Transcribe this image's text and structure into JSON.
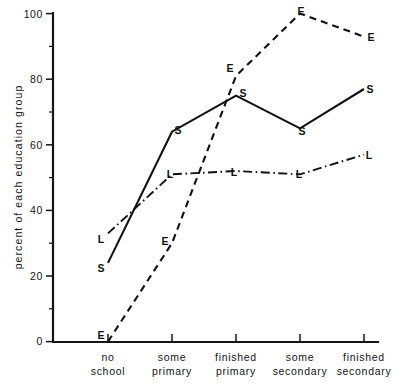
{
  "chart_data": {
    "type": "line",
    "title": "",
    "xlabel": "",
    "ylabel": "percent of each education group",
    "ylim": [
      0,
      100
    ],
    "grid": false,
    "legend_position": "inline-point-labels",
    "categories": [
      "no school",
      "some primary",
      "finished primary",
      "some secondary",
      "finished secondary"
    ],
    "category_lines": [
      [
        "no",
        "school"
      ],
      [
        "some",
        "primary"
      ],
      [
        "finished",
        "primary"
      ],
      [
        "some",
        "secondary"
      ],
      [
        "finished",
        "secondary"
      ]
    ],
    "y_ticks": [
      0,
      20,
      40,
      60,
      80,
      100
    ],
    "y_tick_labels": [
      "0",
      "20",
      "40",
      "60",
      "80",
      "100"
    ],
    "series": [
      {
        "name": "S",
        "marker_letter": "S",
        "line_style": "solid",
        "values": [
          24,
          64,
          75,
          65,
          77
        ]
      },
      {
        "name": "E",
        "marker_letter": "E",
        "line_style": "dashed",
        "values": [
          0,
          30,
          81,
          100,
          93
        ]
      },
      {
        "name": "L",
        "marker_letter": "L",
        "line_style": "dashdot",
        "values": [
          33,
          51,
          52,
          51,
          57
        ]
      }
    ]
  },
  "axis": {
    "y_title": "percent of each education group",
    "y_labels": {
      "t0": "0",
      "t20": "20",
      "t40": "40",
      "t60": "60",
      "t80": "80",
      "t100": "100"
    },
    "x_labels": {
      "c0_line1": "no",
      "c0_line2": "school",
      "c1_line1": "some",
      "c1_line2": "primary",
      "c2_line1": "finished",
      "c2_line2": "primary",
      "c3_line1": "some",
      "c3_line2": "secondary",
      "c4_line1": "finished",
      "c4_line2": "secondary"
    }
  },
  "point_labels": {
    "s0": "S",
    "s1": "S",
    "s2": "S",
    "s3": "S",
    "s4": "S",
    "e0": "E",
    "e1": "E",
    "e2": "E",
    "e3": "E",
    "e4": "E",
    "l0": "L",
    "l1": "L",
    "l2": "L",
    "l3": "L",
    "l4": "L"
  },
  "colors": {
    "ink": "#111111",
    "background": "#ffffff"
  }
}
